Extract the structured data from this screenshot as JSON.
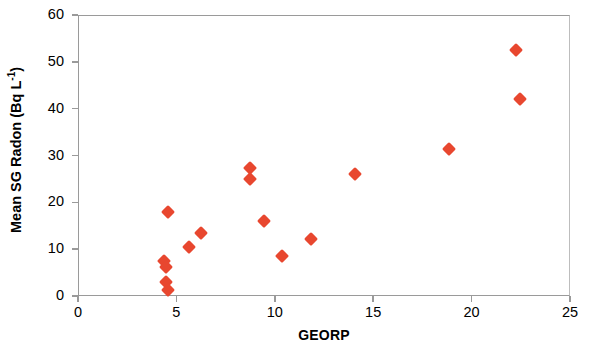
{
  "chart_data": {
    "type": "scatter",
    "title": "",
    "xlabel": "GEORP",
    "ylabel": "Mean SG Radon (Bq L-1)",
    "ylabel_parts": {
      "prefix": "Mean SG Radon (Bq L",
      "exponent": "-1",
      "suffix": ")"
    },
    "xlim": [
      0,
      25
    ],
    "ylim": [
      0,
      60
    ],
    "xticks": [
      0,
      5,
      10,
      15,
      20,
      25
    ],
    "yticks": [
      0,
      10,
      20,
      30,
      40,
      50,
      60
    ],
    "xtick_labels": [
      "0",
      "5",
      "10",
      "15",
      "20",
      "25"
    ],
    "ytick_labels": [
      "0",
      "10",
      "20",
      "30",
      "40",
      "50",
      "60"
    ],
    "grid": false,
    "legend": false,
    "marker": "diamond",
    "marker_color": "#E8472F",
    "frame_color": "#9a9a9a",
    "points": [
      {
        "x": 4.5,
        "y": 18.1
      },
      {
        "x": 4.3,
        "y": 7.6
      },
      {
        "x": 4.4,
        "y": 6.5
      },
      {
        "x": 4.4,
        "y": 3.1
      },
      {
        "x": 4.5,
        "y": 1.4
      },
      {
        "x": 5.6,
        "y": 10.7
      },
      {
        "x": 6.2,
        "y": 13.7
      },
      {
        "x": 8.7,
        "y": 27.6
      },
      {
        "x": 8.7,
        "y": 25.2
      },
      {
        "x": 9.4,
        "y": 16.2
      },
      {
        "x": 10.3,
        "y": 8.7
      },
      {
        "x": 11.8,
        "y": 12.4
      },
      {
        "x": 14.0,
        "y": 26.2
      },
      {
        "x": 18.8,
        "y": 31.7
      },
      {
        "x": 22.2,
        "y": 52.7
      },
      {
        "x": 22.4,
        "y": 42.2
      }
    ]
  }
}
